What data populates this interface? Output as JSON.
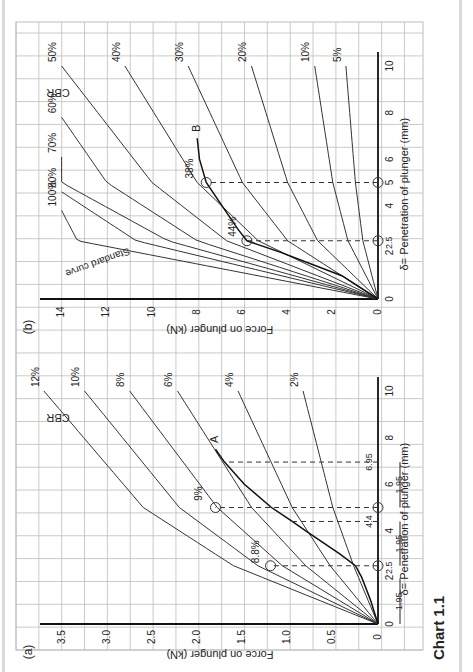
{
  "caption": "Chart 1.1",
  "colors": {
    "grid": "#bdbdbd",
    "axis": "#111111",
    "curve": "#333333",
    "background": "#ffffff"
  },
  "chart_data": [
    {
      "panel": "(a)",
      "type": "line",
      "title": "CBR",
      "xlabel": "δ= Penetration of plunger (mm)",
      "ylabel": "Force on plunger (kN)",
      "xlim": [
        0,
        12
      ],
      "ylim": [
        0,
        3.8
      ],
      "x_ticks": [
        0,
        2,
        2.5,
        4,
        4.4,
        5,
        6,
        6.95,
        8,
        10
      ],
      "y_ticks": [
        0,
        0.5,
        1.0,
        1.5,
        2.0,
        2.5,
        3.0,
        3.5
      ],
      "grid": true,
      "rotation": "90deg clockwise",
      "series": [
        {
          "name": "2%",
          "x": [
            0,
            2.5,
            5,
            10
          ],
          "y": [
            0,
            0.27,
            0.5,
            0.83
          ]
        },
        {
          "name": "4%",
          "x": [
            0,
            2.5,
            5,
            10
          ],
          "y": [
            0,
            0.53,
            0.95,
            1.55
          ]
        },
        {
          "name": "6%",
          "x": [
            0,
            2.5,
            5,
            10
          ],
          "y": [
            0,
            0.8,
            1.4,
            2.22
          ]
        },
        {
          "name": "8%",
          "x": [
            0,
            2.5,
            5,
            10
          ],
          "y": [
            0,
            1.06,
            1.78,
            2.75
          ]
        },
        {
          "name": "10%",
          "x": [
            0,
            2.5,
            5,
            10
          ],
          "y": [
            0,
            1.33,
            2.2,
            3.25
          ]
        },
        {
          "name": "12%",
          "x": [
            0,
            2.5,
            5,
            10
          ],
          "y": [
            0,
            1.6,
            2.6,
            3.7
          ]
        },
        {
          "name": "Curve A",
          "x": [
            0,
            1,
            2,
            2.5,
            3,
            4,
            4.4,
            5,
            6,
            6.95,
            7.5
          ],
          "y": [
            0,
            0.08,
            0.18,
            0.25,
            0.42,
            0.8,
            0.95,
            1.18,
            1.48,
            1.7,
            1.8
          ]
        }
      ],
      "annotations": [
        {
          "text": "A",
          "note": "end label of test curve"
        },
        {
          "text": "8.8%",
          "at_x": 2.5,
          "y": 1.19,
          "note": "CBR at corrected 2.5 mm"
        },
        {
          "text": "9%",
          "at_x": 5.0,
          "y": 1.8,
          "note": "CBR at corrected 5 mm"
        },
        {
          "text": "1.95",
          "note": "origin shift dimension (x3)"
        },
        {
          "text": "4.4"
        },
        {
          "text": "6.95"
        },
        {
          "text": "2.5"
        },
        {
          "text": "5"
        }
      ]
    },
    {
      "panel": "(b)",
      "type": "line",
      "title": "CBR",
      "xlabel": "δ= Penetration of plunger (mm)",
      "ylabel": "Force on plunger (kN)",
      "xlim": [
        0,
        12
      ],
      "ylim": [
        0,
        15
      ],
      "x_ticks": [
        0,
        2,
        2.5,
        4,
        5,
        6,
        8,
        10
      ],
      "y_ticks": [
        0,
        2,
        4,
        6,
        8,
        10,
        12,
        14
      ],
      "grid": true,
      "rotation": "90deg clockwise",
      "series": [
        {
          "name": "5%",
          "x": [
            0,
            2.5,
            5,
            10
          ],
          "y": [
            0,
            0.67,
            1.0,
            1.42
          ]
        },
        {
          "name": "10%",
          "x": [
            0,
            2.5,
            5,
            10
          ],
          "y": [
            0,
            1.33,
            2.0,
            2.8
          ]
        },
        {
          "name": "20%",
          "x": [
            0,
            2.5,
            5,
            10
          ],
          "y": [
            0,
            2.67,
            4.0,
            5.6
          ]
        },
        {
          "name": "30%",
          "x": [
            0,
            2.5,
            5,
            10
          ],
          "y": [
            0,
            4.0,
            6.0,
            8.4
          ]
        },
        {
          "name": "40%",
          "x": [
            0,
            2.5,
            5,
            10
          ],
          "y": [
            0,
            5.3,
            8.0,
            11.2
          ]
        },
        {
          "name": "50%",
          "x": [
            0,
            2.5,
            5,
            10
          ],
          "y": [
            0,
            6.7,
            10.0,
            14.0
          ]
        },
        {
          "name": "60%",
          "x": [
            0,
            2.5,
            5,
            7.8
          ],
          "y": [
            0,
            8.0,
            12.0,
            14.0
          ]
        },
        {
          "name": "70%",
          "x": [
            0,
            2.5,
            5,
            6.1
          ],
          "y": [
            0,
            9.3,
            14.0,
            14.0
          ]
        },
        {
          "name": "80%",
          "x": [
            0,
            2.5,
            4.6
          ],
          "y": [
            0,
            10.7,
            14.0
          ]
        },
        {
          "name": "100% (Standard curve)",
          "x": [
            0,
            2.5,
            3.8
          ],
          "y": [
            0,
            13.3,
            14.0
          ]
        },
        {
          "name": "Curve B",
          "x": [
            0,
            1,
            2,
            2.5,
            3,
            4,
            5,
            6,
            6.9
          ],
          "y": [
            0,
            1.6,
            4.3,
            5.8,
            6.2,
            6.9,
            7.6,
            7.9,
            8.0
          ]
        }
      ],
      "annotations": [
        {
          "text": "B",
          "note": "end label of test curve"
        },
        {
          "text": "44%",
          "at_x": 2.5,
          "note": "CBR at 2.5 mm"
        },
        {
          "text": "38%",
          "at_x": 5.0,
          "note": "CBR at 5 mm"
        },
        {
          "text": "Standard curve"
        },
        {
          "text": "2.5"
        },
        {
          "text": "5"
        }
      ]
    }
  ],
  "panels": {
    "a": {
      "label": "(a)",
      "cbr": "CBR",
      "ylabel": "Force on plunger (kN)",
      "xlabel": "δ= Penetration of plunger (mm)",
      "yticks": [
        "0",
        "0.5",
        "1.0",
        "1.5",
        "2.0",
        "2.5",
        "3.0",
        "3.5"
      ],
      "xticks": [
        "0",
        "2",
        "4",
        "6",
        "8",
        "10"
      ],
      "curve_labels": [
        "2%",
        "4%",
        "6%",
        "8%",
        "10%",
        "12%"
      ],
      "test_curve": "A",
      "pct1": "8.8%",
      "pct2": "9%",
      "dims": [
        "1.95",
        "1.95",
        "1.95"
      ],
      "v44": "4.4",
      "v695": "6.95",
      "v25": "2.5"
    },
    "b": {
      "label": "(b)",
      "cbr": "CBR",
      "ylabel": "Force on plunger (kN)",
      "xlabel": "δ= Penetration of plunger (mm)",
      "yticks": [
        "0",
        "2",
        "4",
        "6",
        "8",
        "10",
        "12",
        "14"
      ],
      "xticks": [
        "0",
        "2",
        "4",
        "5",
        "6",
        "8",
        "10"
      ],
      "curve_labels": [
        "5%",
        "10%",
        "20%",
        "30%",
        "40%",
        "50%",
        "60%",
        "70%",
        "80%",
        "100%"
      ],
      "test_curve": "B",
      "pct1": "44%",
      "pct2": "38%",
      "standard": "Standard curve",
      "v25": "2.5"
    }
  }
}
